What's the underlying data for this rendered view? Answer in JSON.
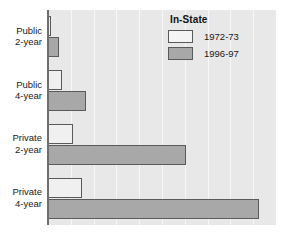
{
  "chart_data": {
    "type": "bar",
    "orientation": "horizontal",
    "title": "",
    "xlabel": "",
    "ylabel": "",
    "grid": "vertical",
    "legend_position": "top-right",
    "legend_title": "In-State",
    "categories": [
      "Public 2-year",
      "Public 4-year",
      "Private 2-year",
      "Private 4-year"
    ],
    "series": [
      {
        "name": "1972-73",
        "values": [
          1.3,
          6.1,
          11.0,
          15.0
        ],
        "color": "#f0f0f0"
      },
      {
        "name": "1996-97",
        "values": [
          4.8,
          16.7,
          60.5,
          92.5
        ],
        "color": "#a8a8a8"
      }
    ],
    "xlim": [
      0,
      100
    ],
    "gridline_count": 9
  },
  "legend": {
    "title": "In-State",
    "entries": [
      {
        "label": "1972-73",
        "swatch": "old"
      },
      {
        "label": "1996-97",
        "swatch": "new"
      }
    ]
  },
  "axis": {
    "category_labels": [
      {
        "line1": "Public",
        "line2": "2-year"
      },
      {
        "line1": "Public",
        "line2": "4-year"
      },
      {
        "line1": "Private",
        "line2": "2-year"
      },
      {
        "line1": "Private",
        "line2": "4-year"
      }
    ]
  },
  "colors": {
    "plot_background": "#e8e8e8",
    "gridline": "#f7f7f7",
    "bar_old": "#f0f0f0",
    "bar_new": "#a8a8a8",
    "bar_edge": "#5a5a5a",
    "text": "#1a1a1a"
  }
}
